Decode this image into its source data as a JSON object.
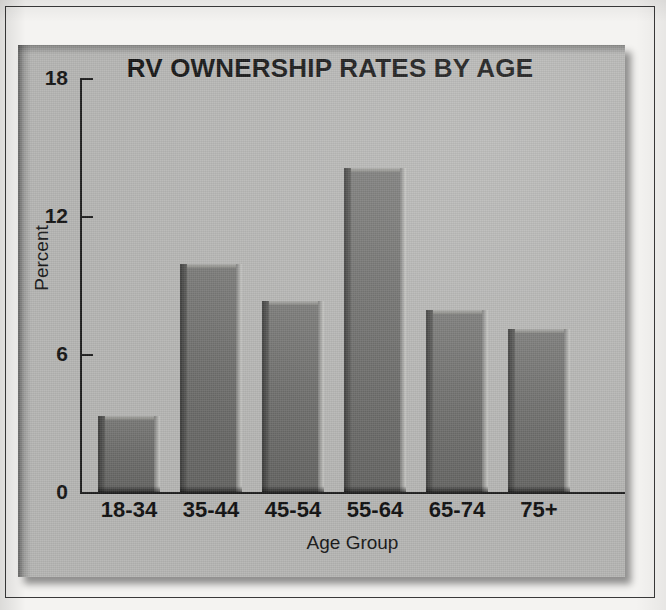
{
  "chart_data": {
    "type": "bar",
    "title": "RV OWNERSHIP RATES BY AGE",
    "xlabel": "Age Group",
    "ylabel": "Percent",
    "categories": [
      "18-34",
      "35-44",
      "45-54",
      "55-64",
      "65-74",
      "75+"
    ],
    "values": [
      3.3,
      9.9,
      8.3,
      14.1,
      7.9,
      7.1
    ],
    "ylim": [
      0,
      18
    ],
    "yticks": [
      "0",
      "6",
      "12",
      "18"
    ],
    "ytick_values": [
      0,
      6,
      12,
      18
    ],
    "grid": false,
    "legend": "none",
    "series": [
      {
        "name": "Percent",
        "values": [
          3.3,
          9.9,
          8.3,
          14.1,
          7.9,
          7.1
        ]
      }
    ],
    "colors": {
      "bar_fill": "#6d6d6b",
      "bar_shadow": "#3b3b3a",
      "bar_highlight": "#c9c9c6",
      "panel_background": "#b5b5b3",
      "page_background": "#f4f3f1",
      "axis": "#1d1d1d",
      "text": "#121212"
    }
  }
}
